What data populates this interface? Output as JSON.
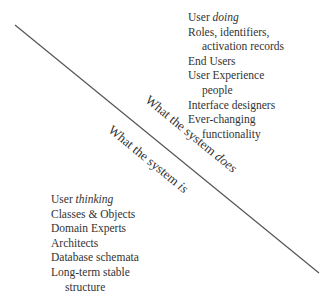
{
  "diagram": {
    "line_color": "#555555",
    "upper_right": {
      "title_prefix": "User ",
      "title_emphasis": "doing",
      "items": [
        {
          "text": "Roles, identifiers,",
          "indent": false
        },
        {
          "text": "activation records",
          "indent": true
        },
        {
          "text": "End Users",
          "indent": false
        },
        {
          "text": "User Experience",
          "indent": false
        },
        {
          "text": "people",
          "indent": true
        },
        {
          "text": "Interface designers",
          "indent": false
        },
        {
          "text": "Ever-changing",
          "indent": false
        },
        {
          "text": "functionality",
          "indent": true
        }
      ]
    },
    "lower_left": {
      "title_prefix": "User ",
      "title_emphasis": "thinking",
      "items": [
        {
          "text": "Classes & Objects",
          "indent": false
        },
        {
          "text": "Domain Experts",
          "indent": false
        },
        {
          "text": "Architects",
          "indent": false
        },
        {
          "text": "Database schemata",
          "indent": false
        },
        {
          "text": "Long-term stable",
          "indent": false
        },
        {
          "text": "structure",
          "indent": true
        }
      ]
    },
    "label_above_line": {
      "prefix": "What the system ",
      "emphasis": "does"
    },
    "label_below_line": {
      "prefix": "What the system ",
      "emphasis": "is"
    }
  }
}
